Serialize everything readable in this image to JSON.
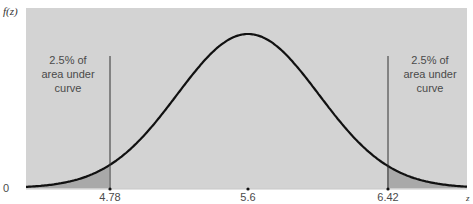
{
  "chart_data": {
    "type": "area",
    "title": "",
    "ylabel": "f(z)",
    "xlabel": "z",
    "distribution": "normal",
    "mean": 5.6,
    "lower_bound": 4.78,
    "upper_bound": 6.42,
    "x_ticks": [
      "4.78",
      "5.6",
      "6.42"
    ],
    "y_ticks": [
      "0"
    ],
    "shaded_regions": [
      {
        "name": "left-tail",
        "range": [
          "-inf",
          4.78
        ],
        "area_pct": 2.5
      },
      {
        "name": "right-tail",
        "range": [
          6.42,
          "inf"
        ],
        "area_pct": 2.5
      }
    ],
    "annotations": [
      {
        "position": "left",
        "lines": [
          "2.5% of",
          "area under",
          "curve"
        ]
      },
      {
        "position": "right",
        "lines": [
          "2.5% of",
          "area under",
          "curve"
        ]
      }
    ],
    "grid": false,
    "colors": {
      "plot_background": "#d3d3d3",
      "tail_fill": "#a9a9a9",
      "curve": "#111111",
      "vline": "#333333",
      "text": "#4a4a4a"
    }
  }
}
